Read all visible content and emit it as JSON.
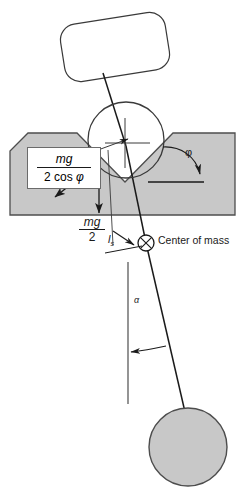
{
  "figure": {
    "background_color": "#ffffff",
    "block_fill": "#c8c8c8",
    "block_stroke": "#4d4d4d",
    "ball_fill": "#c8c8c8",
    "line_color": "#1a1a1a"
  },
  "labels": {
    "normal_force": {
      "numerator": "mg",
      "denominator_prefix": "2 cos ",
      "denominator_symbol": "φ",
      "full": "mg / (2 cos φ)"
    },
    "weight_half": {
      "numerator": "mg",
      "denominator": "2",
      "full": "mg / 2"
    },
    "rod_length": {
      "symbol": "l",
      "subscript": "s",
      "full": "l_s"
    },
    "center_of_mass": "Center of mass",
    "groove_angle": "φ",
    "swing_angle": "α"
  },
  "shapes": {
    "top_body": "rounded-rectangle-tilted",
    "contact_circle": "crosshair-circle",
    "v_block": "v-groove-block",
    "bob": "filled-circle",
    "com_marker": "circle-with-x"
  }
}
